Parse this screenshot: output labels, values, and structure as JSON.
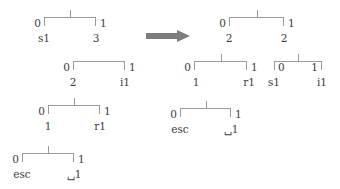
{
  "figure": {
    "type": "binary-tree-transformation-diagram",
    "arrow": {
      "name": "transformation-arrow",
      "direction": "right",
      "color": "#7d7d7d"
    },
    "line_color": "#9a9a9a",
    "text_color": "#3b3b3b"
  },
  "left": {
    "label": "before",
    "trees": [
      {
        "id": "left-tree-1",
        "has_top_stem": true,
        "edge_left": "0",
        "edge_right": "1",
        "child_left": "s1",
        "child_right": "3"
      },
      {
        "id": "left-tree-2",
        "has_top_stem": false,
        "edge_left": "0",
        "edge_right": "1",
        "child_left": "2",
        "child_right": "i1"
      },
      {
        "id": "left-tree-3",
        "has_top_stem": true,
        "edge_left": "0",
        "edge_right": "1",
        "child_left": "1",
        "child_right": "r1"
      },
      {
        "id": "left-tree-4",
        "has_top_stem": true,
        "edge_left": "0",
        "edge_right": "1",
        "child_left": "esc",
        "child_right": "␣1"
      }
    ]
  },
  "right": {
    "label": "after",
    "trees": [
      {
        "id": "right-tree-root",
        "has_top_stem": true,
        "edge_left": "0",
        "edge_right": "1",
        "child_left": "2",
        "child_right": "2"
      },
      {
        "id": "right-tree-left-sub",
        "has_top_stem": true,
        "edge_left": "0",
        "edge_right": "1",
        "child_left": "1",
        "child_right": "r1"
      },
      {
        "id": "right-tree-right-sub",
        "has_top_stem": true,
        "edge_left": "0",
        "edge_right": "1",
        "child_left": "s1",
        "child_right": "i1"
      },
      {
        "id": "right-tree-leaf",
        "has_top_stem": true,
        "edge_left": "0",
        "edge_right": "1",
        "child_left": "esc",
        "child_right": "␣1"
      }
    ]
  }
}
